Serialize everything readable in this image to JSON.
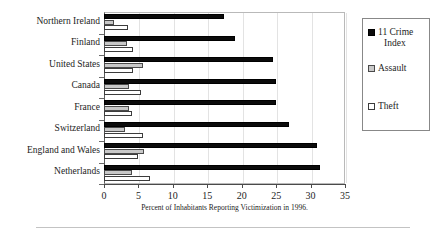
{
  "chart_data": {
    "type": "bar",
    "orientation": "horizontal",
    "title": "",
    "xlabel": "Percent of Inhabitants Reporting Victimization in 1996.",
    "ylabel": "",
    "xlim": [
      0,
      35
    ],
    "xticks": [
      0,
      5,
      10,
      15,
      20,
      25,
      30,
      35
    ],
    "grid": true,
    "legend_position": "right",
    "categories": [
      "Northern Ireland",
      "Finland",
      "United States",
      "Canada",
      "France",
      "Switzerland",
      "England and Wales",
      "Netherlands"
    ],
    "series": [
      {
        "name": "11 Crime Index",
        "color": "#0b0b0b",
        "values": [
          17.4,
          19.0,
          24.5,
          25.0,
          25.0,
          26.8,
          31.0,
          31.4
        ]
      },
      {
        "name": "Assault",
        "color": "#c8c8c8",
        "values": [
          1.5,
          3.3,
          5.6,
          3.6,
          3.6,
          3.0,
          5.8,
          4.0
        ]
      },
      {
        "name": "Theft",
        "color": "#ffffff",
        "values": [
          3.5,
          4.2,
          4.2,
          5.4,
          4.0,
          5.6,
          5.0,
          6.7
        ]
      }
    ]
  },
  "legend": {
    "entries": [
      {
        "label_line1": "11 Crime",
        "label_line2": "Index",
        "icon": "filled-black-square-icon"
      },
      {
        "label_line1": "Assault",
        "label_line2": "",
        "icon": "filled-gray-square-icon"
      },
      {
        "label_line1": "Theft",
        "label_line2": "",
        "icon": "empty-white-square-icon"
      }
    ]
  }
}
